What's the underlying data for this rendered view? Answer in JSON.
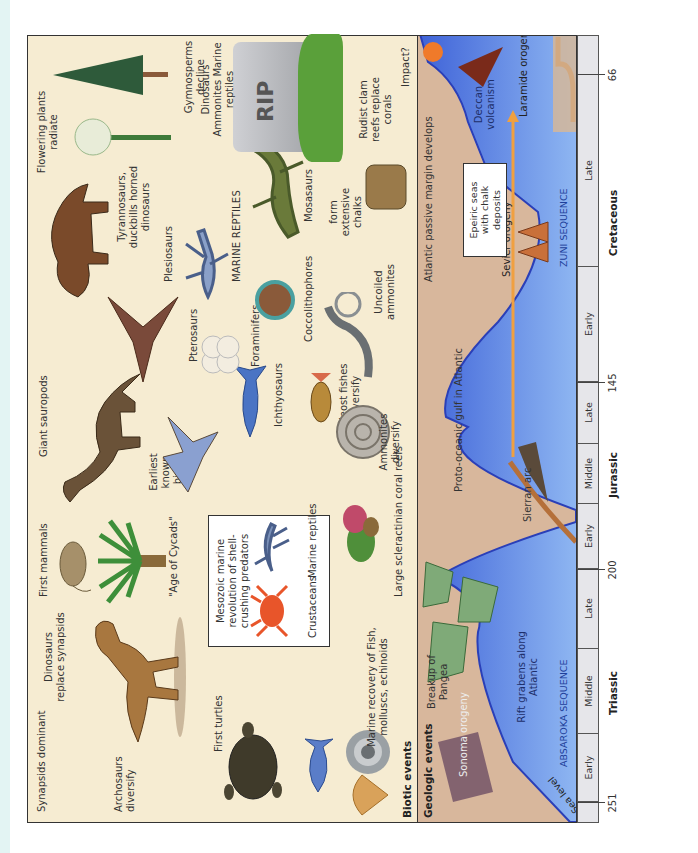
{
  "figure": {
    "orientation": "rotated 90 degrees counter-clockwise",
    "sections": {
      "biotic_title": "Biotic events",
      "geologic_title": "Geologic events"
    },
    "timescale": {
      "ticks": [
        {
          "label": "251"
        },
        {
          "label": "200"
        },
        {
          "label": "145"
        },
        {
          "label": "66"
        }
      ],
      "periods": [
        {
          "name": "Triassic",
          "epochs": [
            "Early",
            "Middle",
            "Late"
          ]
        },
        {
          "name": "Jurassic",
          "epochs": [
            "Early",
            "Middle",
            "Late"
          ]
        },
        {
          "name": "Cretaceous",
          "epochs": [
            "Early",
            "Late"
          ]
        }
      ]
    },
    "biotic_events": {
      "synapsids": "Synapsids dominant",
      "archosaurs": "Archosaurs diversify",
      "dinosaurs_replace": "Dinosaurs replace synapsids",
      "first_turtles": "First turtles",
      "marine_recovery": "Marine recovery of Fish, molluscs, echinoids",
      "first_mammals": "First mammals",
      "age_of_cycads": "\"Age of Cycads\"",
      "mmr_box_title": "Mesozoic marine revolution of shell-crushing predators",
      "crustaceans": "Crustaceans",
      "marine_reptiles_box": "Marine reptiles",
      "coral_reefs": "Large scleractinian coral reefs",
      "giant_sauropods": "Giant sauropods",
      "earliest_birds": "Earliest known birds",
      "ichthyosaurs": "Ichthyosaurs",
      "teleost": "Teleost fishes diversify",
      "ammonites": "Ammonites diversify",
      "pterosaurs": "Pterosaurs",
      "foraminifers": "Foraminifers",
      "coccolithophores": "Coccolithophores",
      "uncoiled": "Uncoiled ammonites",
      "tyrannosaurs": "Tyrannosaurs, duckbills horned dinosaurs",
      "plesiosaurs": "Plesiosaurs",
      "marine_reptiles_caps": "MARINE REPTILES",
      "mosasaurs": "Mosasaurs",
      "form_chalks": "form extensive chalks",
      "flowering_plants": "Flowering plants radiate",
      "gymnosperms": "Gymnosperms decline",
      "rip_list": "Dinosaurs Ammonites Marine reptiles",
      "rip": "RIP",
      "rudist": "Rudist clam reefs replace corals",
      "impact": "Impact?"
    },
    "geologic_events": {
      "sea_level": "Sea level",
      "sonoma": "Sonoma orogeny",
      "pangea": "Breakup of Pangea",
      "rift_grabens": "Rift grabens along Atlantic",
      "absaroka": "ABSAROKA SEQUENCE",
      "sierran_arc": "Sierran arc",
      "proto_oceanic": "Proto-oceanic gulf in Atlantic",
      "atlantic_margin": "Atlantic passive margin develops",
      "sevier": "Sevier orogeny",
      "zuni": "ZUNI SEQUENCE",
      "epeiric": "Epeiric seas with chalk deposits",
      "deccan": "Deccan volcanism",
      "laramide": "Laramide orogeny"
    },
    "colors": {
      "biotic_bg": "#f6ecd2",
      "geologic_land": "#d8b79c",
      "sea_deep": "#3f63d8",
      "sea_light": "#8fb7f2",
      "axis_bg": "#e6e6ea",
      "orogeny_arrow": "#f0a040",
      "sequence_text": "#1e3f9a",
      "continent_green": "#7faa78"
    }
  }
}
